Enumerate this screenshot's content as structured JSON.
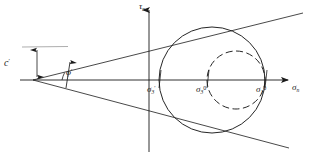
{
  "figure": {
    "background_color": "#ffffff",
    "line_color": "#1a1a1a",
    "width": 309,
    "height": 161
  },
  "axes": {
    "vertical": {
      "name": "shear-stress-axis",
      "label_base": "τ",
      "label_sub": "n",
      "x": 149,
      "y_top": 8,
      "y_bottom": 152
    },
    "horizontal": {
      "name": "normal-stress-axis",
      "label_base": "σ",
      "label_sub": "n",
      "y": 80,
      "x_left": 20,
      "x_right": 290
    }
  },
  "envelope": {
    "apex_x": 33,
    "apex_y": 80,
    "upper_end_x": 302,
    "upper_end_y": 14,
    "lower_end_x": 288,
    "lower_end_y": 148,
    "angle_label_base": "φ",
    "angle_label_sup": "′",
    "cohesion_label_base": "c",
    "cohesion_label_sup": "′"
  },
  "cohesion_dimension": {
    "x": 37,
    "y_top": 47,
    "y_bottom": 80,
    "leader_x_end": 75
  },
  "circles": [
    {
      "name": "mohr-circle-effective",
      "style": "solid",
      "cx": 212,
      "cy": 80,
      "r": 53,
      "left_x": 159,
      "right_x": 265
    },
    {
      "name": "mohr-circle-initial",
      "style": "dashed",
      "cx": 236,
      "cy": 80,
      "r": 29,
      "left_x": 207,
      "right_x": 265
    }
  ],
  "tick_labels": [
    {
      "name": "sigma-3-prime",
      "base": "σ",
      "sub": "3",
      "sup": "′",
      "x_axis": 159
    },
    {
      "name": "sigma-3-zero",
      "base": "σ",
      "sub": "3",
      "sup": "0",
      "x_axis": 207
    },
    {
      "name": "sigma-1-zero",
      "base": "σ",
      "sub": "1",
      "sup": "0",
      "x_axis": 265
    }
  ]
}
